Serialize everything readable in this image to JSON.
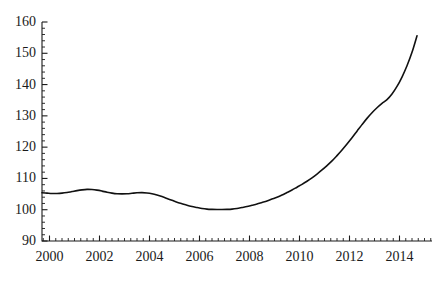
{
  "chart_data": {
    "type": "line",
    "title": "",
    "subtitle": "",
    "xlabel": "",
    "ylabel": "",
    "xlim": [
      1999.7,
      2015.3
    ],
    "ylim": [
      90,
      160
    ],
    "grid": false,
    "legend": null,
    "axis_color": "#1a1a1a",
    "line_color": "#111111",
    "line_width": 1.6,
    "background": "#ffffff",
    "y_ticks": [
      90,
      100,
      110,
      120,
      130,
      140,
      150,
      160
    ],
    "y_tick_labels": [
      "90",
      "100",
      "110",
      "120",
      "130",
      "140",
      "150",
      "160"
    ],
    "y_minor_tick_step": 2,
    "x_ticks": [
      2000,
      2002,
      2004,
      2006,
      2008,
      2010,
      2012,
      2014
    ],
    "x_tick_labels": [
      "2000",
      "2002",
      "2004",
      "2006",
      "2008",
      "2010",
      "2012",
      "2014"
    ],
    "x_minor_tick_step": 0.25,
    "series": [
      {
        "name": "index",
        "x": [
          1999.7,
          1999.9,
          2000.1,
          2000.3,
          2000.5,
          2000.7,
          2000.9,
          2001.1,
          2001.3,
          2001.5,
          2001.7,
          2001.9,
          2002.1,
          2002.3,
          2002.5,
          2002.7,
          2002.9,
          2003.1,
          2003.3,
          2003.5,
          2003.7,
          2003.9,
          2004.1,
          2004.3,
          2004.5,
          2004.7,
          2004.9,
          2005.1,
          2005.3,
          2005.5,
          2005.7,
          2005.9,
          2006.1,
          2006.3,
          2006.5,
          2006.7,
          2006.9,
          2007.1,
          2007.3,
          2007.5,
          2007.7,
          2007.9,
          2008.1,
          2008.3,
          2008.5,
          2008.7,
          2008.9,
          2009.1,
          2009.3,
          2009.5,
          2009.7,
          2009.9,
          2010.1,
          2010.3,
          2010.5,
          2010.7,
          2010.9,
          2011.1,
          2011.3,
          2011.5,
          2011.7,
          2011.9,
          2012.1,
          2012.3,
          2012.5,
          2012.7,
          2012.9,
          2013.1,
          2013.3,
          2013.5,
          2013.7,
          2013.9,
          2014.1,
          2014.3,
          2014.5,
          2014.7
        ],
        "y": [
          105.4,
          105.3,
          105.2,
          105.2,
          105.3,
          105.5,
          105.8,
          106.1,
          106.35,
          106.5,
          106.45,
          106.25,
          105.95,
          105.6,
          105.3,
          105.1,
          105.05,
          105.1,
          105.25,
          105.4,
          105.45,
          105.35,
          105.1,
          104.7,
          104.2,
          103.6,
          103.0,
          102.4,
          101.9,
          101.4,
          101.0,
          100.7,
          100.4,
          100.2,
          100.1,
          100.05,
          100.05,
          100.1,
          100.2,
          100.4,
          100.7,
          101.0,
          101.4,
          101.8,
          102.3,
          102.8,
          103.4,
          104.0,
          104.7,
          105.5,
          106.3,
          107.2,
          108.1,
          109.1,
          110.2,
          111.4,
          112.7,
          114.1,
          115.6,
          117.3,
          119.1,
          121.0,
          123.0,
          125.1,
          127.2,
          129.2,
          131.0,
          132.6,
          134.0,
          135.2,
          137.0,
          139.4,
          142.4,
          146.0,
          150.3,
          155.6
        ]
      }
    ]
  },
  "axes_geometry": {
    "plot_left": 42,
    "plot_right": 432,
    "plot_top": 22,
    "plot_bottom": 241
  }
}
